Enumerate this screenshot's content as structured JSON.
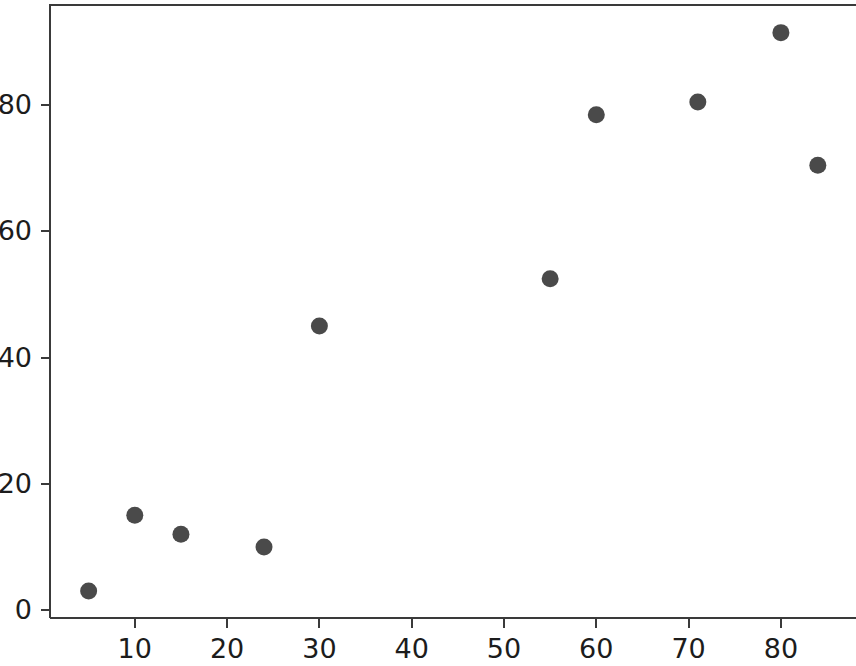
{
  "chart_data": {
    "type": "scatter",
    "title": "",
    "subtitle": "",
    "xlabel": "",
    "ylabel": "",
    "xlim": [
      0,
      88.2
    ],
    "ylim": [
      -1.3,
      96.1
    ],
    "grid": false,
    "legend": null,
    "marker": {
      "shape": "circle",
      "color": "#4a4a4a",
      "size_px": 17
    },
    "xticks": [
      10,
      20,
      30,
      40,
      50,
      60,
      70,
      80
    ],
    "xtick_labels": [
      "10",
      "20",
      "30",
      "40",
      "50",
      "60",
      "70",
      "80"
    ],
    "yticks": [
      0,
      20,
      40,
      60,
      80
    ],
    "ytick_labels": [
      "0",
      "20",
      "40",
      "60",
      "80"
    ],
    "x": [
      5,
      10,
      15,
      24,
      30,
      55,
      60,
      71,
      80,
      84
    ],
    "y": [
      3,
      15,
      12,
      10,
      45,
      52.5,
      78.5,
      80.5,
      91.5,
      70.5
    ],
    "points": [
      {
        "x": 5,
        "y": 3
      },
      {
        "x": 10,
        "y": 15
      },
      {
        "x": 15,
        "y": 12
      },
      {
        "x": 24,
        "y": 10
      },
      {
        "x": 30,
        "y": 45
      },
      {
        "x": 55,
        "y": 52.5
      },
      {
        "x": 60,
        "y": 78.5
      },
      {
        "x": 71,
        "y": 80.5
      },
      {
        "x": 80,
        "y": 91.5
      },
      {
        "x": 84,
        "y": 70.5
      }
    ]
  },
  "axes": {
    "frame_color": "#3a3a3a",
    "background": "#ffffff"
  }
}
